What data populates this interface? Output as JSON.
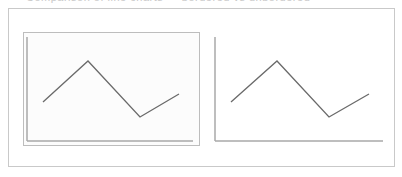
{
  "header": {
    "cut_off_title": "Comparison of line charts — bordered vs unbordered"
  },
  "colors": {
    "frame": "#c9c9c9",
    "inner_frame": "#bdbdbd",
    "axis": "#9a9a9a",
    "line": "#6a6a6a"
  },
  "panels": [
    {
      "name": "bordered-chart",
      "points": "43,102 88,61 140,117 179,94",
      "axis_y": {
        "x": 27,
        "y1": 37,
        "y2": 141
      },
      "axis_x": {
        "y": 141,
        "x1": 27,
        "x2": 193
      }
    },
    {
      "name": "plain-chart",
      "points": "231,102 277,61 329,117 369,94",
      "axis_y": {
        "x": 215,
        "y1": 37,
        "y2": 141
      },
      "axis_x": {
        "y": 141,
        "x1": 215,
        "x2": 383
      }
    }
  ]
}
